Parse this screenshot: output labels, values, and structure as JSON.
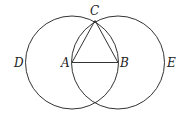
{
  "diagram": {
    "title": "",
    "stroke_color": "#333333",
    "points": {
      "A": {
        "label": "A",
        "x": 72,
        "y": 62
      },
      "B": {
        "label": "B",
        "x": 118,
        "y": 62
      },
      "C": {
        "label": "C",
        "x": 95,
        "y": 21
      },
      "D": {
        "label": "D",
        "x": 26,
        "y": 62
      },
      "E": {
        "label": "E",
        "x": 164,
        "y": 62
      }
    },
    "circles": [
      {
        "name": "circle-centered-A",
        "cx": 72,
        "cy": 62,
        "r": 46
      },
      {
        "name": "circle-centered-B",
        "cx": 118,
        "cy": 62,
        "r": 46
      }
    ],
    "segments": [
      {
        "name": "segment-AB",
        "from": "A",
        "to": "B"
      },
      {
        "name": "segment-AC",
        "from": "A",
        "to": "C"
      },
      {
        "name": "segment-BC",
        "from": "B",
        "to": "C"
      }
    ],
    "labels": {
      "A": "A",
      "B": "B",
      "C": "C",
      "D": "D",
      "E": "E"
    }
  }
}
